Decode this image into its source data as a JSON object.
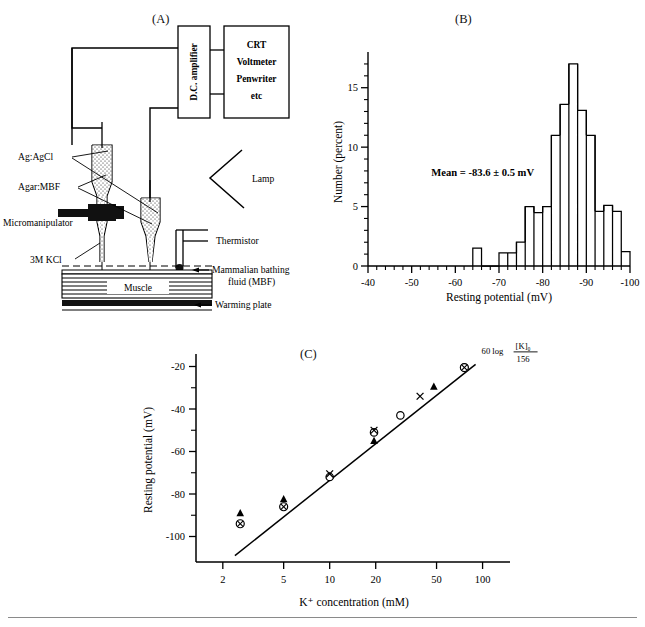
{
  "figure": {
    "panels": {
      "a_label": "(A)",
      "b_label": "(B)",
      "c_label": "(C)"
    }
  },
  "panel_a": {
    "title": "(A)",
    "description": "Experimental setup schematic for intracellular recording from mammalian muscle",
    "labels": {
      "ag_agcl": "Ag:AgCl",
      "agar_mbf": "Agar:MBF",
      "micromanipulator": "Micromanipulator",
      "kcl": "3M KCl",
      "amplifier": "D.C. amplifier",
      "crt_line1": "CRT",
      "crt_line2": "Voltmeter",
      "crt_line3": "Penwriter",
      "crt_line4": "etc",
      "lamp": "Lamp",
      "thermistor": "Thermistor",
      "mbf_line1": "Mammalian bathing",
      "mbf_line2": "fluid (MBF)",
      "muscle": "Muscle",
      "warming_plate": "Warming plate"
    }
  },
  "chart_data": [
    {
      "panel": "B",
      "type": "bar",
      "title": "(B)",
      "xlabel": "Resting potential (mV)",
      "ylabel": "Number (percent)",
      "xlim": [
        -40,
        -100
      ],
      "ylim": [
        0,
        17.5
      ],
      "x_ticks": [
        -40,
        -50,
        -60,
        -70,
        -80,
        -90,
        -100
      ],
      "x_tick_labels": [
        "-40",
        "-50",
        "-60",
        "-70",
        "-80",
        "-90",
        "-100"
      ],
      "y_ticks": [
        0,
        5,
        10,
        15
      ],
      "y_tick_labels": [
        "0",
        "5",
        "10",
        "15"
      ],
      "x_minor_step": 2,
      "y_minor_step": 1,
      "grid": false,
      "bin_width": 2,
      "annotation": "Mean =  -83.6 ± 0.5 mV",
      "annotation_x": -54.5,
      "annotation_y": 7.6,
      "bin_starts": [
        -64,
        -70,
        -72,
        -74,
        -76,
        -78,
        -80,
        -82,
        -84,
        -86,
        -88,
        -90,
        -92,
        -94,
        -96
      ],
      "values": [
        1.5,
        1.1,
        1.1,
        2.0,
        5.0,
        4.5,
        5.0,
        11.0,
        13.6,
        17.0,
        13.1,
        11.0,
        4.6,
        5.1,
        4.6
      ],
      "tail_bin_start": -98,
      "tail_value": 1.2,
      "categories": [
        "-64",
        "-70",
        "-72",
        "-74",
        "-76",
        "-78",
        "-80",
        "-82",
        "-84",
        "-86",
        "-88",
        "-90",
        "-92",
        "-94",
        "-96",
        "-98"
      ]
    },
    {
      "panel": "C",
      "type": "scatter",
      "title": "(C)",
      "xlabel": "K⁺ concentration (mM)",
      "ylabel": "Resting potential (mV)",
      "x_scale": "log",
      "xlim": [
        1.6,
        130
      ],
      "ylim": [
        -112,
        -16
      ],
      "x_ticks": [
        2,
        5,
        10,
        20,
        50,
        100
      ],
      "x_tick_labels": [
        "2",
        "5",
        "10",
        "20",
        "50",
        "100"
      ],
      "y_ticks": [
        -20,
        -40,
        -60,
        -80,
        -100
      ],
      "y_tick_labels": [
        "-20",
        "-40",
        "-60",
        "-80",
        "-100"
      ],
      "y_minor_ticks": [
        -30,
        -50,
        -70,
        -90
      ],
      "grid": false,
      "line": {
        "label": "60 log [K]o/156",
        "label_main": "60 log",
        "label_num": "[K]₀",
        "label_den": "156",
        "x_start": 2.4,
        "y_start": -109,
        "x_end": 90,
        "y_end": -19
      },
      "series": [
        {
          "name": "filled-triangle",
          "marker": "triangle",
          "points": [
            {
              "x": 2.6,
              "y": -89
            },
            {
              "x": 5.0,
              "y": -82.5
            },
            {
              "x": 10.0,
              "y": -71.5
            },
            {
              "x": 19.5,
              "y": -55
            },
            {
              "x": 48,
              "y": -29.5
            }
          ]
        },
        {
          "name": "open-circle",
          "marker": "circle",
          "points": [
            {
              "x": 10.0,
              "y": -72
            },
            {
              "x": 19.5,
              "y": -51
            },
            {
              "x": 29,
              "y": -43
            },
            {
              "x": 76,
              "y": -20.5
            }
          ]
        },
        {
          "name": "circle-cross",
          "marker": "circle-cross",
          "points": [
            {
              "x": 2.6,
              "y": -94
            },
            {
              "x": 5.0,
              "y": -86
            },
            {
              "x": 76,
              "y": -20.5
            }
          ]
        },
        {
          "name": "cross",
          "marker": "cross",
          "points": [
            {
              "x": 10.0,
              "y": -70.5
            },
            {
              "x": 19.5,
              "y": -50
            },
            {
              "x": 39,
              "y": -34
            }
          ]
        }
      ]
    }
  ]
}
